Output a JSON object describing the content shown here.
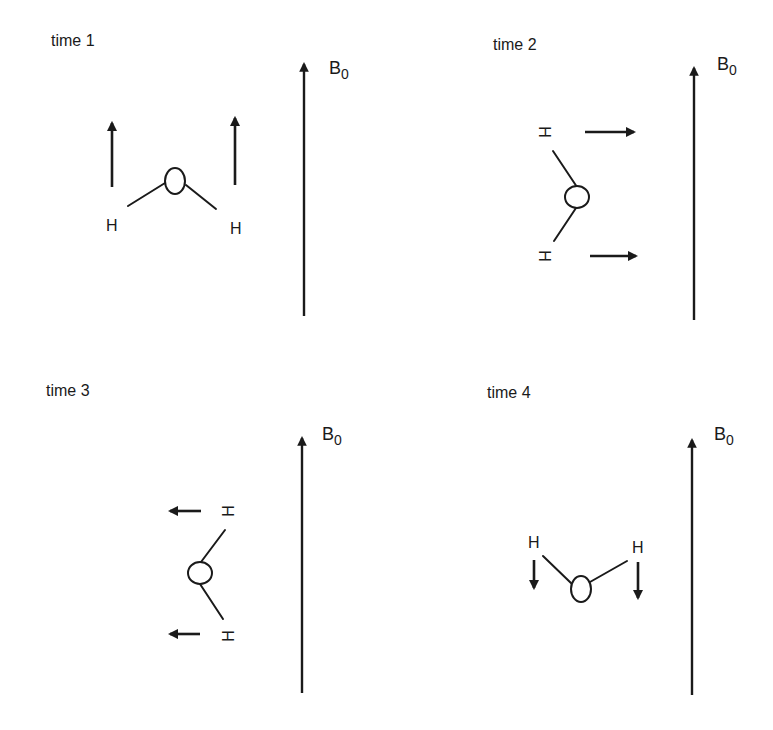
{
  "figure": {
    "panels": [
      {
        "id": "time-1",
        "label": "time 1",
        "field_label": "B",
        "field_subscript": "0",
        "molecule": {
          "oxygen": "O",
          "hydrogens": [
            "H",
            "H"
          ],
          "orientation": "V opening downward, H atoms below"
        },
        "spin_direction": "up (parallel to B0)"
      },
      {
        "id": "time-2",
        "label": "time 2",
        "field_label": "B",
        "field_subscript": "0",
        "molecule": {
          "oxygen": "O",
          "hydrogens": [
            "H",
            "H"
          ],
          "orientation": "rotated 90°, H atoms on left"
        },
        "spin_direction": "right (perpendicular to B0)"
      },
      {
        "id": "time-3",
        "label": "time 3",
        "field_label": "B",
        "field_subscript": "0",
        "molecule": {
          "oxygen": "O",
          "hydrogens": [
            "H",
            "H"
          ],
          "orientation": "rotated -90°, H atoms on right"
        },
        "spin_direction": "left (perpendicular to B0)"
      },
      {
        "id": "time-4",
        "label": "time 4",
        "field_label": "B",
        "field_subscript": "0",
        "molecule": {
          "oxygen": "O",
          "hydrogens": [
            "H",
            "H"
          ],
          "orientation": "V opening upward, H atoms above"
        },
        "spin_direction": "down (antiparallel to B0)"
      }
    ],
    "atom_label_h": "H",
    "colors": {
      "ink": "#1a1a1a",
      "background": "#ffffff"
    }
  }
}
